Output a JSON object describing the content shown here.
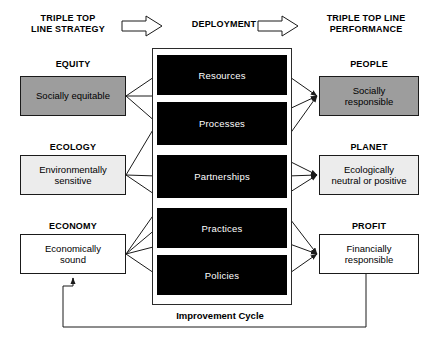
{
  "diagram": {
    "headers": [
      {
        "id": "strategy",
        "text": "TRIPLE TOP\nLINE STRATEGY",
        "x": 14,
        "y": 13,
        "w": 108
      },
      {
        "id": "deployment",
        "text": "DEPLOYMENT",
        "x": 176,
        "y": 19,
        "w": 96
      },
      {
        "id": "performance",
        "text": "TRIPLE TOP LINE\nPERFORMANCE",
        "x": 310,
        "y": 13,
        "w": 112
      }
    ],
    "flow_arrows": [
      {
        "id": "arrow-strategy-to-deployment",
        "x": 122,
        "y": 18,
        "w": 50,
        "h": 16
      },
      {
        "id": "arrow-deployment-to-performance",
        "x": 258,
        "y": 18,
        "w": 50,
        "h": 16
      }
    ],
    "left_column": [
      {
        "id": "equity",
        "category": "EQUITY",
        "label": "Socially equitable",
        "fill": "dark",
        "cat_y": 59,
        "box_y": 76,
        "box_h": 40
      },
      {
        "id": "ecology",
        "category": "ECOLOGY",
        "label": "Environmentally\nsensitive",
        "fill": "light",
        "cat_y": 142,
        "box_y": 155,
        "box_h": 40
      },
      {
        "id": "economy",
        "category": "ECONOMY",
        "label": "Economically\nsound",
        "fill": "white",
        "cat_y": 221,
        "box_y": 234,
        "box_h": 40
      }
    ],
    "right_column": [
      {
        "id": "people",
        "category": "PEOPLE",
        "label": "Socially\nresponsible",
        "fill": "dark",
        "cat_y": 59,
        "box_y": 76,
        "box_h": 40
      },
      {
        "id": "planet",
        "category": "PLANET",
        "label": "Ecologically\nneutral or positive",
        "fill": "light",
        "cat_y": 142,
        "box_y": 155,
        "box_h": 40
      },
      {
        "id": "profit",
        "category": "PROFIT",
        "label": "Financially\nresponsible",
        "fill": "white",
        "cat_y": 221,
        "box_y": 234,
        "box_h": 40
      }
    ],
    "left_box_x": 20,
    "left_box_w": 106,
    "right_box_x": 319,
    "right_box_w": 100,
    "container": {
      "x": 152,
      "y": 48,
      "w": 140,
      "h": 257
    },
    "core_blocks": [
      {
        "id": "resources",
        "label": "Resources",
        "y": 55,
        "h": 40
      },
      {
        "id": "processes",
        "label": "Processes",
        "y": 102,
        "h": 43
      },
      {
        "id": "partnerships",
        "label": "Partnerships",
        "y": 155,
        "h": 43
      },
      {
        "id": "practices",
        "label": "Practices",
        "y": 208,
        "h": 40
      },
      {
        "id": "policies",
        "label": "Policies",
        "y": 255,
        "h": 40
      }
    ],
    "core_block_x": 157,
    "core_block_w": 130,
    "cycle": {
      "label": "Improvement Cycle",
      "frame": {
        "x": 63,
        "y": 278,
        "w": 303,
        "h": 49
      },
      "label_x": 160,
      "label_y": 310,
      "label_w": 120
    },
    "colors": {
      "fill_dark": "#9d9d9d",
      "fill_light": "#ececec",
      "fill_white": "#ffffff",
      "core_block": "#000000",
      "core_block_text": "#ffffff",
      "line": "#1a1a1a",
      "background": "#ffffff"
    }
  }
}
